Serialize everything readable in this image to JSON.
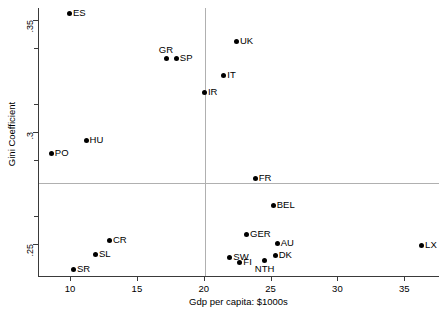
{
  "chart_data": {
    "type": "scatter",
    "title": "",
    "xlabel": "Gdp per capita: $1000s",
    "ylabel": "Gini Coefficient",
    "xlim": [
      7.6,
      37.6
    ],
    "ylim": [
      0.2355,
      0.3555
    ],
    "xticks": [
      10,
      15,
      20,
      25,
      30,
      35
    ],
    "xticklabels": [
      "10",
      "15",
      "20",
      "25",
      "30",
      "35"
    ],
    "yticks": [
      0.25,
      0.3,
      0.35
    ],
    "yticklabels": [
      ".25",
      ".3",
      ".35"
    ],
    "y_minor_ticks": [
      0.2625,
      0.2875,
      0.3125,
      0.3375
    ],
    "grid": false,
    "reference_lines": {
      "vertical_x": 20.1,
      "horizontal_y": 0.2773
    },
    "points": [
      {
        "label": "ES",
        "x": 9.95,
        "y": 0.353,
        "label_pos": "right"
      },
      {
        "label": "GR",
        "x": 17.25,
        "y": 0.333,
        "label_pos": "above"
      },
      {
        "label": "SP",
        "x": 17.95,
        "y": 0.333,
        "label_pos": "right"
      },
      {
        "label": "UK",
        "x": 22.45,
        "y": 0.3405,
        "label_pos": "right"
      },
      {
        "label": "IT",
        "x": 21.5,
        "y": 0.3255,
        "label_pos": "right"
      },
      {
        "label": "IR",
        "x": 20.05,
        "y": 0.3175,
        "label_pos": "right"
      },
      {
        "label": "HU",
        "x": 11.2,
        "y": 0.296,
        "label_pos": "right"
      },
      {
        "label": "PO",
        "x": 8.6,
        "y": 0.2905,
        "label_pos": "right"
      },
      {
        "label": "FR",
        "x": 23.85,
        "y": 0.279,
        "label_pos": "right"
      },
      {
        "label": "BEL",
        "x": 25.2,
        "y": 0.267,
        "label_pos": "right"
      },
      {
        "label": "GER",
        "x": 23.2,
        "y": 0.254,
        "label_pos": "right"
      },
      {
        "label": "AU",
        "x": 25.5,
        "y": 0.25,
        "label_pos": "right"
      },
      {
        "label": "CR",
        "x": 12.95,
        "y": 0.2515,
        "label_pos": "right"
      },
      {
        "label": "SL",
        "x": 11.9,
        "y": 0.245,
        "label_pos": "right"
      },
      {
        "label": "SR",
        "x": 10.25,
        "y": 0.2385,
        "label_pos": "right"
      },
      {
        "label": "SW",
        "x": 21.95,
        "y": 0.244,
        "label_pos": "right"
      },
      {
        "label": "FI",
        "x": 22.7,
        "y": 0.2415,
        "label_pos": "right"
      },
      {
        "label": "NTH",
        "x": 24.55,
        "y": 0.2425,
        "label_pos": "below"
      },
      {
        "label": "DK",
        "x": 25.35,
        "y": 0.2445,
        "label_pos": "right"
      },
      {
        "label": "LX",
        "x": 36.3,
        "y": 0.249,
        "label_pos": "right"
      }
    ],
    "marker_color": "#000000",
    "axis_color": "#3a3a3a",
    "reference_line_color": "#b0b0b0"
  }
}
